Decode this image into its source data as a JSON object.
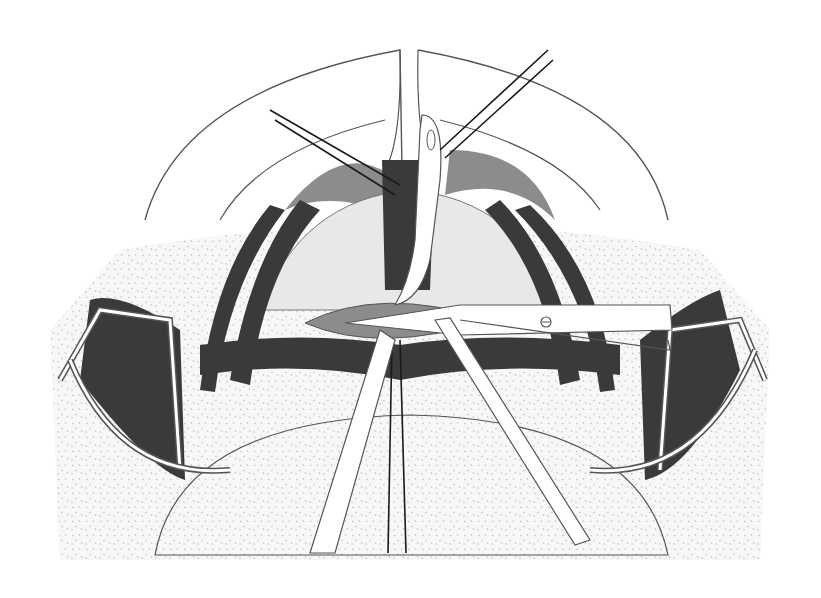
{
  "figure": {
    "title": "Surgical illustration: tracheal / midline neck procedure with retractors, forceps and scissors"
  },
  "colors": {
    "background": "#ffffff",
    "outline": "#555555",
    "dark_tissue": "#3a3a3a",
    "mid_tissue": "#8c8c8c",
    "light_tissue": "#e4e4e4",
    "skin_speckle": "#f2f2f2",
    "instrument": "#ffffff",
    "suture": "#1a1a1a"
  },
  "elements": {
    "outer_arc": "head-outline",
    "midline_tube": "tube-instrument",
    "stay_sutures": 2,
    "retractors": 2,
    "scissors": 1,
    "forceps": 2
  }
}
